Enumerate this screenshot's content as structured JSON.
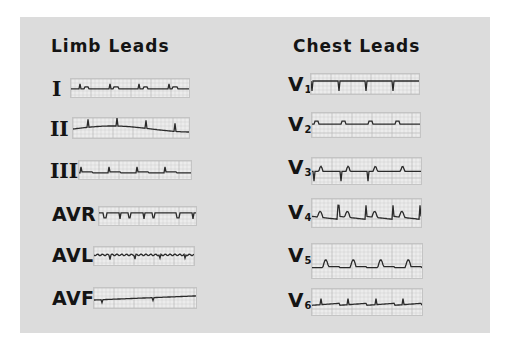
{
  "headings": {
    "limb": "Limb Leads",
    "chest": "Chest Leads"
  },
  "limb_leads": [
    {
      "label": "I",
      "style": "roman",
      "trace": "flat-small"
    },
    {
      "label": "II",
      "style": "roman",
      "trace": "wander"
    },
    {
      "label": "III",
      "style": "roman",
      "trace": "up-small"
    },
    {
      "label": "AVR",
      "style": "sans",
      "trace": "inverted"
    },
    {
      "label": "AVL",
      "style": "sans",
      "trace": "noisy"
    },
    {
      "label": "AVF",
      "style": "sans",
      "trace": "rising"
    }
  ],
  "chest_leads": [
    {
      "label": "V",
      "sub": "1",
      "trace": "down-deep"
    },
    {
      "label": "V",
      "sub": "2",
      "trace": "biphasic"
    },
    {
      "label": "V",
      "sub": "3",
      "trace": "biphasic-t"
    },
    {
      "label": "V",
      "sub": "4",
      "trace": "tall-t"
    },
    {
      "label": "V",
      "sub": "5",
      "trace": "tall-t-down"
    },
    {
      "label": "V",
      "sub": "6",
      "trace": "small-up"
    }
  ],
  "colors": {
    "panel": "#dcdcdc",
    "grid": "#b8b8b8",
    "trace": "#2a2a2a",
    "text": "#141414"
  }
}
